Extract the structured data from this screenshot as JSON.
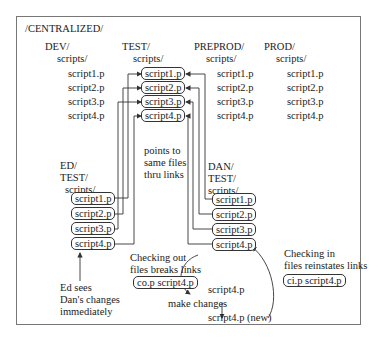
{
  "root": {
    "label": "/CENTRALIZED/"
  },
  "environments": [
    {
      "name": "DEV/",
      "folder": "scripts/",
      "files": [
        "script1.p",
        "script2.p",
        "script3.p",
        "script4.p"
      ]
    },
    {
      "name": "TEST/",
      "folder": "scripts/",
      "files": [
        "script1.p",
        "script2.p",
        "script3.p",
        "script4.p"
      ]
    },
    {
      "name": "PREPROD/",
      "folder": "scripts/",
      "files": [
        "script1.p",
        "script2.p",
        "script3.p",
        "script4.p"
      ]
    },
    {
      "name": "PROD/",
      "folder": "scripts/",
      "files": [
        "script1.p",
        "script2.p",
        "script3.p",
        "script4.p"
      ]
    }
  ],
  "users": {
    "ed": {
      "user": "ED/",
      "env": "TEST/",
      "folder": "scripts/",
      "files": [
        "script1.p",
        "script2.p",
        "script3.p",
        "script4.p"
      ]
    },
    "dan": {
      "user": "DAN/",
      "env": "TEST/",
      "folder": "scripts/",
      "files": [
        "script1.p",
        "script2.p",
        "script3.p",
        "script4.p"
      ]
    }
  },
  "annotations": {
    "links_note": [
      "points to",
      "same files",
      "thru links"
    ],
    "ed_note": [
      "Ed sees",
      "Dan's changes",
      "immediately"
    ],
    "checkout_note": [
      "Checking out",
      "files breaks links"
    ],
    "checkout_cmd": "co.p script4.p",
    "checkin_note": [
      "Checking in",
      "files reinstates links"
    ],
    "checkin_cmd": "ci.p script4.p",
    "local_file": "script4.p",
    "make_changes": "make changes",
    "new_file": "script4.p (new)"
  },
  "colors": {
    "line": "#333333",
    "frame": "#777777",
    "text": "#222222"
  }
}
